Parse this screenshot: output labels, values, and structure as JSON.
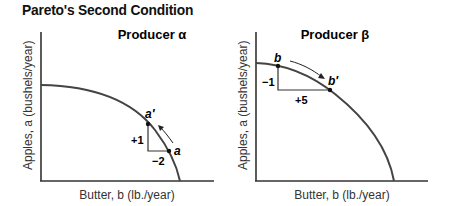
{
  "figure": {
    "title": "Pareto's Second Condition"
  },
  "panels": [
    {
      "title": "Producer α",
      "xlabel": "Butter, b (lb./year)",
      "ylabel": "Apples, a (bushels/year)",
      "points": [
        {
          "label": "a′"
        },
        {
          "label": "a"
        }
      ],
      "changes": {
        "vertical": "+1",
        "horizontal": "−2"
      }
    },
    {
      "title": "Producer β",
      "xlabel": "Butter, b (lb./year)",
      "ylabel": "Apples, a (bushels/year)",
      "points": [
        {
          "label": "b"
        },
        {
          "label": "b′"
        }
      ],
      "changes": {
        "vertical": "−1",
        "horizontal": "+5"
      }
    }
  ],
  "colors": {
    "curve": "#444444",
    "axis": "#333333",
    "text": "#111111"
  }
}
